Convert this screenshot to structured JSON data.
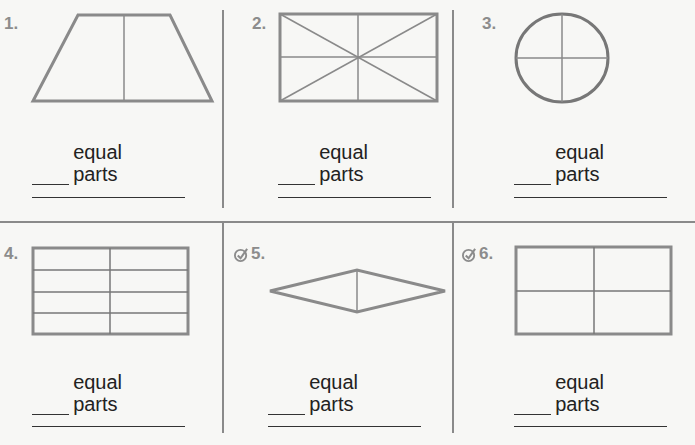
{
  "worksheet": {
    "problems": [
      {
        "number": "1.",
        "shape": "trapezoid",
        "divisions": "1 vertical line",
        "label": "equal parts",
        "has_check_icon": false
      },
      {
        "number": "2.",
        "shape": "rectangle",
        "divisions": "vertical, horizontal and 2 diagonals",
        "label": "equal parts",
        "has_check_icon": false
      },
      {
        "number": "3.",
        "shape": "circle",
        "divisions": "vertical and horizontal",
        "label": "equal parts",
        "has_check_icon": false
      },
      {
        "number": "4.",
        "shape": "rectangle",
        "divisions": "1 vertical, 3 horizontal",
        "label": "equal parts",
        "has_check_icon": false
      },
      {
        "number": "5.",
        "shape": "rhombus",
        "divisions": "1 vertical line",
        "label": "equal parts",
        "has_check_icon": true
      },
      {
        "number": "6.",
        "shape": "rectangle",
        "divisions": "vertical and horizontal (unequal)",
        "label": "equal parts",
        "has_check_icon": true
      }
    ]
  },
  "colors": {
    "shape_stroke": "#8a8a8a",
    "number_text": "#8c8c8c",
    "text": "#222222",
    "background": "#f7f7f5"
  }
}
